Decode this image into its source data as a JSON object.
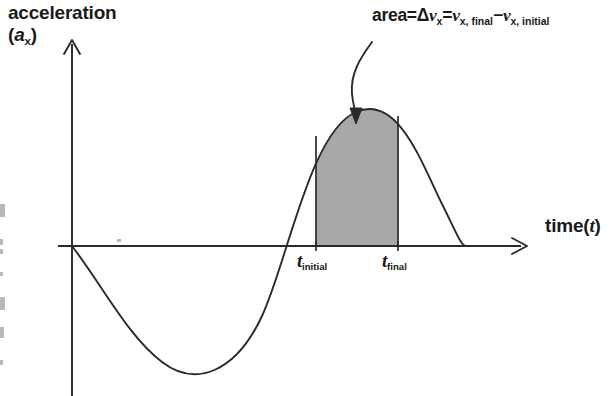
{
  "figure": {
    "background_color": "#ffffff",
    "ink_color": "#1a1a1a",
    "shaded_area_color": "#a8a8a8"
  },
  "axes": {
    "y_title_line1": "acceleration",
    "y_title_line2_prefix": "(",
    "y_title_line2_symbol": "a",
    "y_title_line2_subscript": "x",
    "y_title_line2_suffix": ")",
    "x_title_text": "time(",
    "x_title_symbol": "t",
    "x_title_suffix": ")"
  },
  "ticks": [
    {
      "symbol": "t",
      "subscript": "initial"
    },
    {
      "symbol": "t",
      "subscript": "final"
    }
  ],
  "annotation": {
    "area_word": "area=",
    "delta": "Δ",
    "v1_symbol": "v",
    "v1_subscript": "x",
    "equals": "=",
    "v2_symbol": "v",
    "v2_subscript": "x, final",
    "minus": "−",
    "v3_symbol": "v",
    "v3_subscript": "x, initial"
  },
  "chart_data": {
    "type": "area",
    "title": "",
    "xlabel": "time (t)",
    "ylabel": "acceleration (a_x)",
    "grid": false,
    "legend_position": "none",
    "xlim": [
      0,
      1
    ],
    "ylim": [
      -1.15,
      1.05
    ],
    "x_tick_labels": [
      "t_initial",
      "t_final"
    ],
    "x_tick_values": [
      0.537,
      0.718
    ],
    "y_tick_labels": [],
    "shaded_region": {
      "x_start": 0.537,
      "x_end": 0.718,
      "baseline": 0
    },
    "series": [
      {
        "name": "a_x(t)",
        "x": [
          0.0,
          0.05,
          0.1,
          0.15,
          0.2,
          0.25,
          0.3,
          0.35,
          0.4,
          0.45,
          0.5,
          0.55,
          0.6,
          0.65,
          0.7,
          0.75,
          0.8,
          0.85,
          0.9,
          0.95,
          1.0
        ],
        "y": [
          0.0,
          -0.3,
          -0.59,
          -0.81,
          -0.97,
          -1.05,
          -1.03,
          -0.93,
          -0.74,
          -0.49,
          -0.2,
          0.12,
          0.43,
          0.7,
          0.9,
          1.0,
          0.99,
          0.87,
          0.65,
          0.35,
          0.0
        ]
      }
    ]
  },
  "scan_fragments": [
    {
      "x": 0,
      "y": 204,
      "w": 5,
      "h": 13
    },
    {
      "x": 0,
      "y": 239,
      "w": 3,
      "h": 6
    },
    {
      "x": 0,
      "y": 249,
      "w": 3,
      "h": 5
    },
    {
      "x": 0,
      "y": 272,
      "w": 3,
      "h": 4
    },
    {
      "x": 0,
      "y": 297,
      "w": 5,
      "h": 13
    },
    {
      "x": 0,
      "y": 327,
      "w": 4,
      "h": 11
    },
    {
      "x": 0,
      "y": 360,
      "w": 3,
      "h": 5
    },
    {
      "x": 117,
      "y": 239,
      "w": 4,
      "h": 3
    }
  ]
}
